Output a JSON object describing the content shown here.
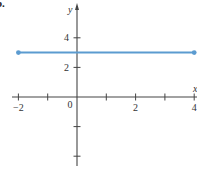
{
  "panel_label": "b.",
  "chart_data": {
    "type": "line",
    "title": "",
    "xlabel": "x",
    "ylabel": "y",
    "xlim": [
      -2,
      4
    ],
    "ylim": [
      -5,
      5
    ],
    "grid": false,
    "x_tick_labels": [
      {
        "value": -2,
        "label": "−2"
      },
      {
        "value": 0,
        "label": "0"
      },
      {
        "value": 2,
        "label": "2"
      },
      {
        "value": 4,
        "label": "4"
      }
    ],
    "y_tick_labels": [
      {
        "value": 4,
        "label": "4"
      },
      {
        "value": 2,
        "label": "2"
      }
    ],
    "x_ticks": [
      -2,
      -1,
      1,
      2,
      3,
      4
    ],
    "y_ticks": [
      4,
      2,
      -2,
      -4
    ],
    "series": [
      {
        "name": "y = 3",
        "color": "#5b9bd0",
        "x": [
          -2,
          4
        ],
        "y": [
          3,
          3
        ],
        "endpoints": "closed"
      }
    ]
  }
}
